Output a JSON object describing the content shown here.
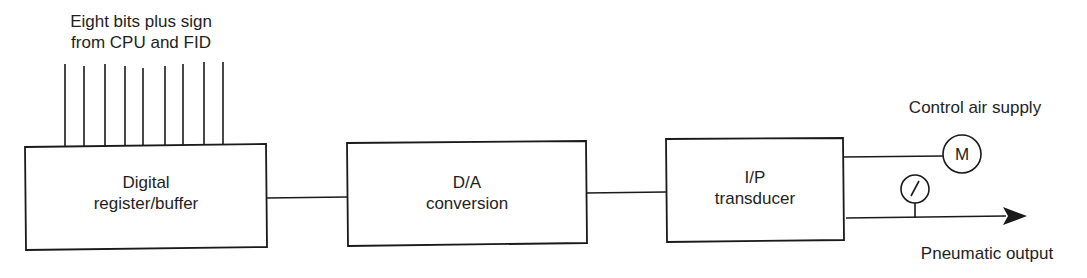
{
  "diagram": {
    "input_label": {
      "line1": "Eight bits plus sign",
      "line2": "from CPU and FID"
    },
    "input_lines_count": 9,
    "blocks": [
      {
        "id": "register",
        "line1": "Digital",
        "line2": "register/buffer"
      },
      {
        "id": "dac",
        "line1": "D/A",
        "line2": "conversion"
      },
      {
        "id": "ip",
        "line1": "I/P",
        "line2": "transducer"
      }
    ],
    "supply_label": "Control air supply",
    "supply_symbol": "M",
    "gauge_symbol": "pressure-gauge",
    "output_label": "Pneumatic output",
    "colors": {
      "line": "#1a1a1a",
      "text": "#1e1e1e",
      "background": "#ffffff"
    }
  }
}
